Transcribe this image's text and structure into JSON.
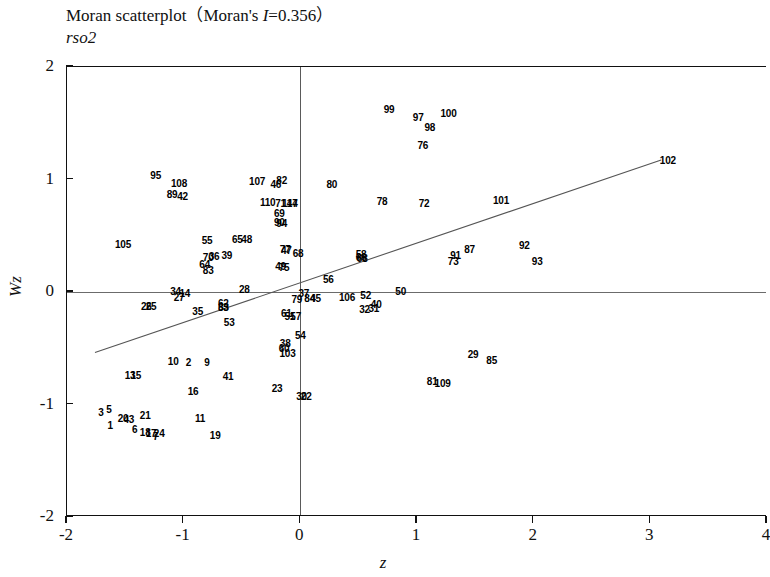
{
  "title": {
    "prefix": "Moran scatterplot（Moran's ",
    "stat_symbol": "I",
    "stat_value": "=0.356）"
  },
  "subtitle": "rso2",
  "axes": {
    "x_label": "z",
    "y_label": "Wz",
    "x_ticks": [
      "-2",
      "-1",
      "0",
      "1",
      "2",
      "3",
      "4"
    ],
    "y_ticks": [
      "2",
      "1",
      "0",
      "-1",
      "-2"
    ],
    "xlim": [
      -2,
      4
    ],
    "ylim": [
      -2,
      2
    ]
  },
  "chart_data": {
    "type": "scatter",
    "title": "Moran scatterplot（Moran's I=0.356）",
    "subtitle": "rso2",
    "xlabel": "z",
    "ylabel": "Wz",
    "xlim": [
      -2,
      4
    ],
    "ylim": [
      -2,
      2
    ],
    "moran_i": 0.356,
    "grid": false,
    "legend": "none",
    "reference_lines": [
      {
        "name": "x-zero",
        "orientation": "vertical",
        "value": 0
      },
      {
        "name": "y-zero",
        "orientation": "horizontal",
        "value": 0
      }
    ],
    "fit_line": {
      "x0": -1.76,
      "y0": -0.55,
      "x1": 3.1,
      "y1": 1.17
    },
    "point_labels_are_ids": true,
    "points": [
      {
        "label": "1",
        "x": -1.63,
        "y": -1.18
      },
      {
        "label": "2",
        "x": -0.96,
        "y": -0.62
      },
      {
        "label": "3",
        "x": -1.71,
        "y": -1.07
      },
      {
        "label": "5",
        "x": -1.64,
        "y": -1.04
      },
      {
        "label": "6",
        "x": -1.42,
        "y": -1.22
      },
      {
        "label": "7",
        "x": -1.24,
        "y": -1.28
      },
      {
        "label": "9",
        "x": -0.8,
        "y": -0.62
      },
      {
        "label": "10",
        "x": -1.09,
        "y": -0.61
      },
      {
        "label": "11",
        "x": -0.86,
        "y": -1.12
      },
      {
        "label": "13",
        "x": -1.46,
        "y": -0.74
      },
      {
        "label": "15",
        "x": -1.41,
        "y": -0.74
      },
      {
        "label": "14",
        "x": -0.99,
        "y": -0.01
      },
      {
        "label": "16",
        "x": -0.92,
        "y": -0.88
      },
      {
        "label": "17",
        "x": -1.28,
        "y": -1.25
      },
      {
        "label": "18",
        "x": -1.33,
        "y": -1.24
      },
      {
        "label": "19",
        "x": -0.73,
        "y": -1.27
      },
      {
        "label": "20",
        "x": -1.52,
        "y": -1.12
      },
      {
        "label": "21",
        "x": -1.33,
        "y": -1.09
      },
      {
        "label": "22",
        "x": 0.05,
        "y": -0.92
      },
      {
        "label": "23",
        "x": -0.2,
        "y": -0.85
      },
      {
        "label": "24",
        "x": -1.21,
        "y": -1.25
      },
      {
        "label": "25",
        "x": -1.28,
        "y": -0.12
      },
      {
        "label": "26",
        "x": -1.32,
        "y": -0.12
      },
      {
        "label": "27",
        "x": -1.04,
        "y": -0.04
      },
      {
        "label": "28",
        "x": -0.48,
        "y": 0.03
      },
      {
        "label": "29",
        "x": 1.48,
        "y": -0.55
      },
      {
        "label": "30",
        "x": 0.01,
        "y": -0.92
      },
      {
        "label": "31",
        "x": 0.63,
        "y": -0.14
      },
      {
        "label": "32",
        "x": 0.55,
        "y": -0.15
      },
      {
        "label": "33",
        "x": -0.66,
        "y": -0.13
      },
      {
        "label": "34",
        "x": -1.07,
        "y": 0.01
      },
      {
        "label": "35",
        "x": -0.88,
        "y": -0.17
      },
      {
        "label": "36",
        "x": -0.74,
        "y": 0.32
      },
      {
        "label": "37",
        "x": 0.03,
        "y": -0.01
      },
      {
        "label": "38",
        "x": -0.13,
        "y": -0.45
      },
      {
        "label": "39",
        "x": -0.63,
        "y": 0.33
      },
      {
        "label": "40",
        "x": 0.65,
        "y": -0.11
      },
      {
        "label": "41",
        "x": -0.62,
        "y": -0.75
      },
      {
        "label": "42",
        "x": -1.01,
        "y": 0.85
      },
      {
        "label": "43",
        "x": -1.47,
        "y": -1.13
      },
      {
        "label": "45",
        "x": 0.13,
        "y": -0.05
      },
      {
        "label": "46",
        "x": -0.21,
        "y": 0.96
      },
      {
        "label": "47",
        "x": -0.12,
        "y": 0.37
      },
      {
        "label": "48",
        "x": -0.46,
        "y": 0.47
      },
      {
        "label": "49",
        "x": -0.17,
        "y": 0.23
      },
      {
        "label": "50",
        "x": 0.86,
        "y": 0.01
      },
      {
        "label": "51",
        "x": -0.09,
        "y": -0.21
      },
      {
        "label": "52",
        "x": 0.56,
        "y": -0.03
      },
      {
        "label": "53",
        "x": -0.61,
        "y": -0.27
      },
      {
        "label": "54",
        "x": 0.0,
        "y": -0.38
      },
      {
        "label": "55",
        "x": -0.8,
        "y": 0.46
      },
      {
        "label": "56",
        "x": 0.24,
        "y": 0.12
      },
      {
        "label": "57",
        "x": -0.04,
        "y": -0.21
      },
      {
        "label": "58",
        "x": 0.52,
        "y": 0.34
      },
      {
        "label": "60",
        "x": -0.14,
        "y": -0.5
      },
      {
        "label": "61",
        "x": -0.12,
        "y": -0.19
      },
      {
        "label": "62",
        "x": -0.66,
        "y": -0.1
      },
      {
        "label": "63",
        "x": -0.66,
        "y": -0.13
      },
      {
        "label": "64",
        "x": -0.82,
        "y": 0.25
      },
      {
        "label": "65",
        "x": -0.54,
        "y": 0.47
      },
      {
        "label": "66",
        "x": 0.52,
        "y": 0.31
      },
      {
        "label": "68",
        "x": -0.02,
        "y": 0.35
      },
      {
        "label": "68b",
        "x": 0.53,
        "y": 0.3
      },
      {
        "label": "69",
        "x": -0.18,
        "y": 0.7
      },
      {
        "label": "70",
        "x": -0.79,
        "y": 0.31
      },
      {
        "label": "71",
        "x": -0.17,
        "y": 0.79
      },
      {
        "label": "72",
        "x": 1.06,
        "y": 0.79
      },
      {
        "label": "73",
        "x": 1.31,
        "y": 0.28
      },
      {
        "label": "75",
        "x": -0.14,
        "y": 0.22
      },
      {
        "label": "76",
        "x": 1.05,
        "y": 1.31
      },
      {
        "label": "77",
        "x": -0.13,
        "y": 0.38
      },
      {
        "label": "78",
        "x": 0.7,
        "y": 0.81
      },
      {
        "label": "79",
        "x": -0.03,
        "y": -0.06
      },
      {
        "label": "80",
        "x": 0.27,
        "y": 0.96
      },
      {
        "label": "81",
        "x": 1.13,
        "y": -0.79
      },
      {
        "label": "82",
        "x": -0.16,
        "y": 1.0
      },
      {
        "label": "83",
        "x": -0.79,
        "y": 0.2
      },
      {
        "label": "84",
        "x": 0.08,
        "y": -0.05
      },
      {
        "label": "85",
        "x": 1.64,
        "y": -0.6
      },
      {
        "label": "87",
        "x": 1.45,
        "y": 0.38
      },
      {
        "label": "89",
        "x": -1.1,
        "y": 0.87
      },
      {
        "label": "90",
        "x": -0.18,
        "y": 0.62
      },
      {
        "label": "91",
        "x": 1.33,
        "y": 0.33
      },
      {
        "label": "92",
        "x": 1.92,
        "y": 0.42
      },
      {
        "label": "93",
        "x": 2.03,
        "y": 0.28
      },
      {
        "label": "94",
        "x": -0.16,
        "y": 0.61
      },
      {
        "label": "95",
        "x": -1.24,
        "y": 1.04
      },
      {
        "label": "97",
        "x": 1.01,
        "y": 1.56
      },
      {
        "label": "98",
        "x": 1.11,
        "y": 1.47
      },
      {
        "label": "99",
        "x": 0.76,
        "y": 1.63
      },
      {
        "label": "100",
        "x": 1.27,
        "y": 1.59
      },
      {
        "label": "101",
        "x": 1.72,
        "y": 0.82
      },
      {
        "label": "102",
        "x": 3.15,
        "y": 1.17
      },
      {
        "label": "103",
        "x": -0.11,
        "y": -0.54
      },
      {
        "label": "105",
        "x": -1.52,
        "y": 0.43
      },
      {
        "label": "106",
        "x": 0.4,
        "y": -0.04
      },
      {
        "label": "107",
        "x": -0.37,
        "y": 0.99
      },
      {
        "label": "108",
        "x": -1.04,
        "y": 0.97
      },
      {
        "label": "109",
        "x": 1.22,
        "y": -0.81
      },
      {
        "label": "110",
        "x": -0.28,
        "y": 0.8
      },
      {
        "label": "114",
        "x": -0.09,
        "y": 0.79
      },
      {
        "label": "47b",
        "x": -0.07,
        "y": 0.79
      }
    ]
  }
}
